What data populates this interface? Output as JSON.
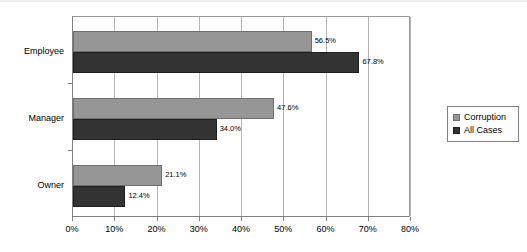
{
  "chart_data": {
    "type": "bar",
    "orientation": "horizontal",
    "title": "",
    "xlabel": "",
    "ylabel": "",
    "categories": [
      "Employee",
      "Manager",
      "Owner"
    ],
    "series": [
      {
        "name": "Corruption",
        "color": "#969696",
        "values": [
          56.5,
          47.6,
          21.1
        ],
        "labels": [
          "56.5%",
          "47.6%",
          "21.1%"
        ]
      },
      {
        "name": "All Cases",
        "color": "#333333",
        "values": [
          67.8,
          34.0,
          12.4
        ],
        "labels": [
          "67.8%",
          "34.0%",
          "12.4%"
        ]
      }
    ],
    "xlim": [
      0,
      80
    ],
    "xticks": [
      0,
      10,
      20,
      30,
      40,
      50,
      60,
      70,
      80
    ],
    "xticklabels": [
      "0%",
      "10%",
      "20%",
      "30%",
      "40%",
      "50%",
      "60%",
      "70%",
      "80%"
    ],
    "grid": "vertical",
    "legend_position": "right",
    "legend_entries": [
      "Corruption",
      "All Cases"
    ]
  }
}
